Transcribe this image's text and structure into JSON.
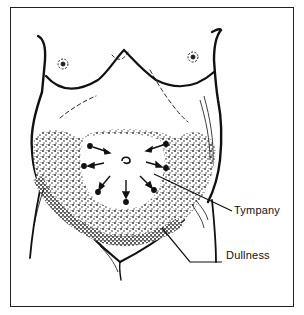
{
  "figure": {
    "labels": {
      "tympany": "Tympany",
      "dullness": "Dullness"
    },
    "colors": {
      "ink": "#111111",
      "background": "#ffffff"
    },
    "percussion_arrows": 8
  }
}
